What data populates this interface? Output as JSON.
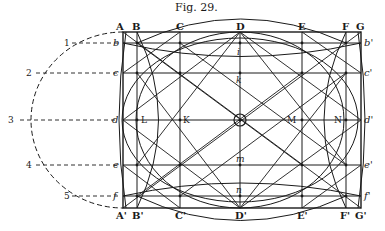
{
  "caption": "Fig. 29.",
  "top_labels": [
    "A",
    "B",
    "C",
    "D",
    "E",
    "F",
    "G"
  ],
  "bottom_labels": [
    "A'",
    "B'",
    "C'",
    "D'",
    "E'",
    "F'",
    "G'"
  ],
  "left_labels": [
    "b",
    "c",
    "d",
    "e",
    "f"
  ],
  "right_labels": [
    "b'",
    "c'",
    "d'",
    "e'",
    "f'"
  ],
  "arc_labels": [
    "1",
    "2",
    "3",
    "4",
    "5"
  ],
  "interior_labels": {
    "L": "L",
    "K": "K",
    "M": "M",
    "N": "N",
    "h": "i",
    "k": "k",
    "m": "m",
    "n": "n"
  },
  "center_marker": "O"
}
